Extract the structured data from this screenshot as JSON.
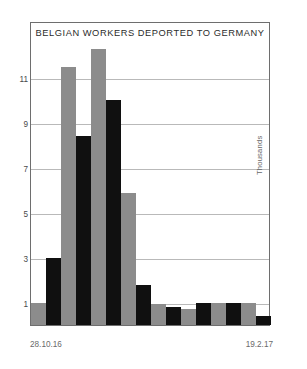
{
  "chart_data": {
    "type": "bar",
    "title": "BELGIAN WORKERS DEPORTED TO GERMANY",
    "xlabel": "",
    "ylabel": "Thousands",
    "ylim": [
      0,
      12.6
    ],
    "grid": true,
    "legend": null,
    "yticks": [
      1,
      3,
      5,
      7,
      9,
      11
    ],
    "ytick_labels": [
      "1",
      "3",
      "5",
      "7",
      "9",
      "11"
    ],
    "x_axis_start_label": "28.10.16",
    "x_axis_end_label": "19.2.17",
    "categories": [
      "1",
      "2",
      "3",
      "4",
      "5",
      "6",
      "7",
      "8",
      "9",
      "10",
      "11",
      "12",
      "13",
      "14",
      "15",
      "16"
    ],
    "values": [
      1.0,
      3.0,
      11.5,
      8.4,
      12.3,
      10.0,
      5.9,
      1.8,
      0.95,
      0.8,
      0.7,
      0.97,
      0.97,
      0.97,
      0.97,
      0.4
    ],
    "bar_colors": [
      "#8c8c8c",
      "#101010",
      "#8c8c8c",
      "#101010",
      "#8c8c8c",
      "#101010",
      "#8c8c8c",
      "#101010",
      "#8c8c8c",
      "#101010",
      "#8c8c8c",
      "#101010",
      "#8c8c8c",
      "#101010",
      "#8c8c8c",
      "#101010"
    ],
    "colors": {
      "gray_bar": "#8c8c8c",
      "black_bar": "#101010",
      "gridline": "#b9b9b9",
      "frame": "#6e6e6e",
      "text": "#4a4a4a",
      "background": "#ffffff"
    }
  },
  "axis": {
    "left_date": "28.10.16",
    "right_date": "19.2.17",
    "unit_label": "Thousands"
  }
}
